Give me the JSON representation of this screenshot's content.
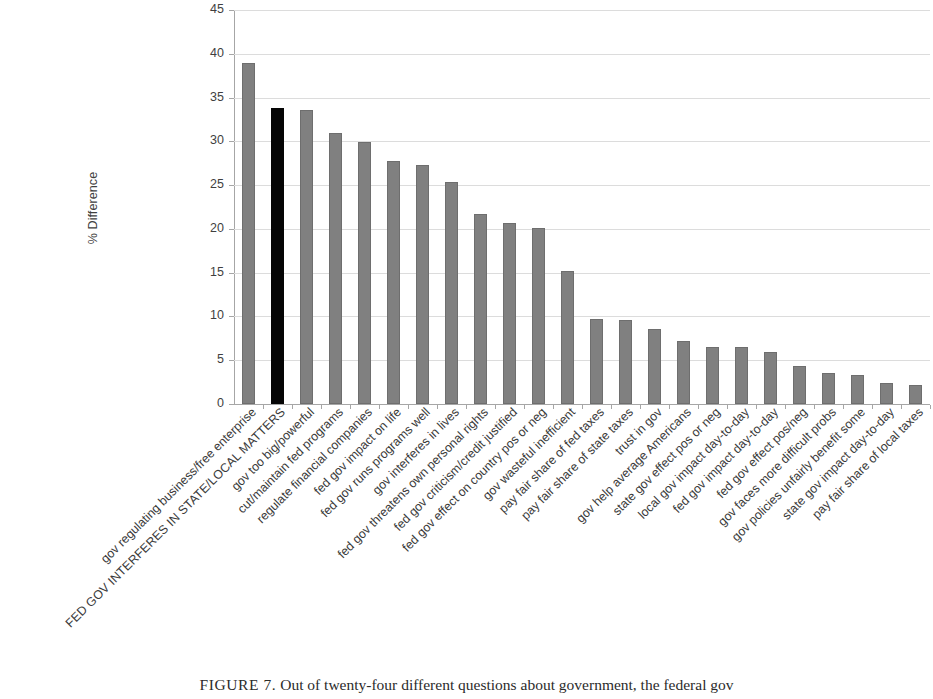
{
  "chart_data": {
    "type": "bar",
    "title": "",
    "xlabel": "",
    "ylabel": "% Difference",
    "ylim": [
      0,
      45
    ],
    "yticks": [
      0,
      5,
      10,
      15,
      20,
      25,
      30,
      35,
      40,
      45
    ],
    "grid": true,
    "legend": "none",
    "highlight_index": 1,
    "highlight_color": "#050505",
    "bar_color": "#808080",
    "categories": [
      "gov regulating business/free enterprise",
      "FED GOV INTERFERES IN STATE/LOCAL MATTERS",
      "gov too big/powerful",
      "cut/maintain fed programs",
      "regulate financial companies",
      "fed gov impact on life",
      "fed gov runs programs well",
      "gov interferes in lives",
      "fed gov threatens own personal rights",
      "fed gov criticism/credit justified",
      "fed gov effect on country pos or neg",
      "gov wasteful inefficient",
      "pay fair share of fed taxes",
      "pay fair share of state taxes",
      "trust in gov",
      "gov help average Americans",
      "state gov effect pos or neg",
      "local gov impact day-to-day",
      "fed gov impact day-to-day",
      "fed gov effect pos/neg",
      "gov faces more difficult probs",
      "gov policies unfairly benefit some",
      "state gov impact day-to-day",
      "pay fair share of local taxes"
    ],
    "values": [
      39.0,
      33.8,
      33.6,
      31.0,
      29.9,
      27.7,
      27.3,
      25.4,
      21.7,
      20.7,
      20.1,
      15.2,
      9.7,
      9.6,
      8.6,
      7.2,
      6.5,
      6.5,
      5.9,
      4.3,
      3.5,
      3.3,
      2.4,
      2.2
    ]
  },
  "axis": {
    "y_title": "% Difference",
    "y_tick_labels": [
      "45",
      "40",
      "35",
      "30",
      "25",
      "20",
      "15",
      "10",
      "5",
      "0"
    ]
  },
  "caption": {
    "figure_number": "FIGURE 7.",
    "text": "Out of twenty-four different questions about government, the federal gov"
  }
}
